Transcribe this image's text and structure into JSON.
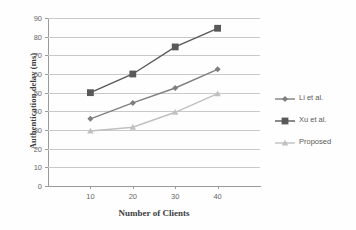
{
  "chart_data": {
    "type": "line",
    "title": "",
    "xlabel": "Number of Clients",
    "ylabel": "Authentication delay (ms)",
    "categories": [
      "10",
      "20",
      "30",
      "40"
    ],
    "x": [
      10,
      20,
      30,
      40
    ],
    "xlim": [
      0,
      50
    ],
    "ylim": [
      0,
      90
    ],
    "yticks": [
      "0",
      "10",
      "20",
      "30",
      "40",
      "50",
      "60",
      "70",
      "80",
      "90"
    ],
    "ytick_values": [
      0,
      10,
      20,
      30,
      40,
      50,
      60,
      70,
      80,
      90
    ],
    "grid": "horizontal",
    "legend_position": "right",
    "series": [
      {
        "name": "Li et al.",
        "values": [
          36,
          44.5,
          52.5,
          62.5
        ],
        "color": "#7f7f7f",
        "marker": "diamond"
      },
      {
        "name": "Xu et al.",
        "values": [
          50,
          60,
          74.5,
          84.5
        ],
        "color": "#595959",
        "marker": "square"
      },
      {
        "name": "Proposed",
        "values": [
          29.5,
          31.5,
          39.5,
          49.5
        ],
        "color": "#c0c0c0",
        "marker": "triangle"
      }
    ]
  },
  "axes": {
    "grid_color": "#c9c9c9",
    "axis_color": "#9a9a9a",
    "tick_text_color": "#666666",
    "title_color": "#3d3d3d"
  }
}
